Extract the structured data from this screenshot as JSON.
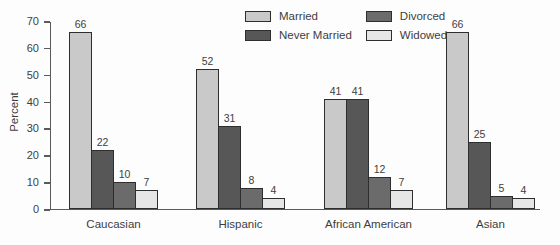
{
  "chart_data": {
    "type": "bar",
    "title": "",
    "xlabel": "",
    "ylabel": "Percent",
    "ylim": [
      0,
      70
    ],
    "ytick_step": 10,
    "grid": false,
    "legend_position": "top-center",
    "categories": [
      "Caucasian",
      "Hispanic",
      "African American",
      "Asian"
    ],
    "series": [
      {
        "name": "Married",
        "color": "#c9c9c9",
        "values": [
          66,
          52,
          41,
          66
        ]
      },
      {
        "name": "Never Married",
        "color": "#575757",
        "values": [
          22,
          31,
          41,
          25
        ]
      },
      {
        "name": "Divorced",
        "color": "#6b6b6b",
        "values": [
          10,
          8,
          12,
          5
        ]
      },
      {
        "name": "Widowed",
        "color": "#e6e6e6",
        "values": [
          7,
          4,
          7,
          4
        ]
      }
    ],
    "axis_color": "#5a5a5a",
    "bar_border_color": "#2e2e2e"
  }
}
